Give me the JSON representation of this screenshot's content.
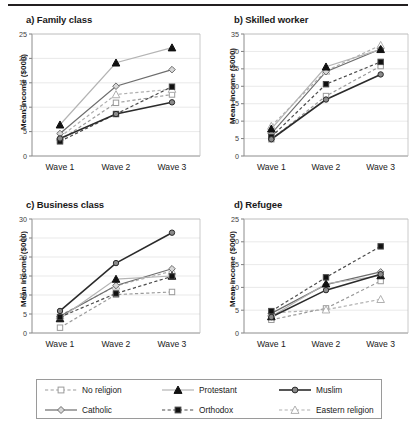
{
  "figure": {
    "ylabel": "Mean income ($000)",
    "waves": [
      "Wave 1",
      "Wave 2",
      "Wave 3"
    ]
  },
  "legend": {
    "items": [
      {
        "label": "No religion",
        "marker": "open-square",
        "dash": "dashed",
        "color": "#9b9b9b",
        "fill": "#ffffff"
      },
      {
        "label": "Catholic",
        "marker": "open-diamond",
        "dash": "solid",
        "color": "#6d6d6d",
        "fill": "#d8d8d8"
      },
      {
        "label": "Protestant",
        "marker": "filled-triangle",
        "dash": "solid",
        "color": "#b4b4b4",
        "fill": "#111111"
      },
      {
        "label": "Orthodox",
        "marker": "filled-square",
        "dash": "dashed",
        "color": "#4a4a4a",
        "fill": "#111111"
      },
      {
        "label": "Muslim",
        "marker": "filled-circle",
        "dash": "solid",
        "color": "#2b2b2b",
        "fill": "#8a8a8a"
      },
      {
        "label": "Eastern religion",
        "marker": "open-triangle",
        "dash": "dashed",
        "color": "#b0b0b0",
        "fill": "#ffffff"
      }
    ]
  },
  "chart_data": [
    {
      "type": "line",
      "panel": "a",
      "title": "a)  Family class",
      "xlabel": "",
      "ylabel": "Mean income ($000)",
      "categories": [
        "Wave 1",
        "Wave 2",
        "Wave 3"
      ],
      "ylim": [
        0,
        25
      ],
      "yticks": [
        0,
        5,
        10,
        15,
        20,
        25
      ],
      "grid": true,
      "legend_position": "below-figure",
      "series": [
        {
          "name": "No religion",
          "values": [
            3.2,
            10.9,
            12.6
          ]
        },
        {
          "name": "Catholic",
          "values": [
            4.6,
            14.3,
            17.7
          ]
        },
        {
          "name": "Protestant",
          "values": [
            6.4,
            19.1,
            22.2
          ]
        },
        {
          "name": "Orthodox",
          "values": [
            3.0,
            8.6,
            14.2
          ]
        },
        {
          "name": "Muslim",
          "values": [
            3.6,
            8.6,
            11.0
          ]
        },
        {
          "name": "Eastern religion",
          "values": [
            3.9,
            12.6,
            13.7
          ]
        }
      ]
    },
    {
      "type": "line",
      "panel": "b",
      "title": "b)  Skilled worker",
      "xlabel": "",
      "ylabel": "Mean income ($000)",
      "categories": [
        "Wave 1",
        "Wave 2",
        "Wave 3"
      ],
      "ylim": [
        0,
        35
      ],
      "yticks": [
        0,
        5,
        10,
        15,
        20,
        25,
        30,
        35
      ],
      "grid": true,
      "legend_position": "below-figure",
      "series": [
        {
          "name": "No religion",
          "values": [
            4.8,
            17.2,
            25.8
          ]
        },
        {
          "name": "Catholic",
          "values": [
            6.4,
            24.2,
            30.7
          ]
        },
        {
          "name": "Protestant",
          "values": [
            7.8,
            25.6,
            30.6
          ]
        },
        {
          "name": "Orthodox",
          "values": [
            5.5,
            20.6,
            27.0
          ]
        },
        {
          "name": "Muslim",
          "values": [
            4.8,
            16.2,
            23.4
          ]
        },
        {
          "name": "Eastern religion",
          "values": [
            8.6,
            24.4,
            31.8
          ]
        }
      ]
    },
    {
      "type": "line",
      "panel": "c",
      "title": "c)  Business class",
      "xlabel": "",
      "ylabel": "Mean income ($000)",
      "categories": [
        "Wave 1",
        "Wave 2",
        "Wave 3"
      ],
      "ylim": [
        0,
        30
      ],
      "yticks": [
        0,
        5,
        10,
        15,
        20,
        25,
        30
      ],
      "grid": true,
      "legend_position": "below-figure",
      "series": [
        {
          "name": "No religion",
          "values": [
            1.4,
            10.1,
            10.8
          ]
        },
        {
          "name": "Catholic",
          "values": [
            4.4,
            12.5,
            16.9
          ]
        },
        {
          "name": "Protestant",
          "values": [
            3.8,
            14.2,
            15.0
          ]
        },
        {
          "name": "Orthodox",
          "values": [
            4.2,
            10.4,
            14.9
          ]
        },
        {
          "name": "Muslim",
          "values": [
            5.8,
            18.4,
            26.4
          ]
        },
        {
          "name": "Eastern religion",
          "values": [
            4.6,
            12.4,
            16.3
          ]
        }
      ]
    },
    {
      "type": "line",
      "panel": "d",
      "title": "d)  Refugee",
      "xlabel": "",
      "ylabel": "Mean income ($000)",
      "categories": [
        "Wave 1",
        "Wave 2",
        "Wave 3"
      ],
      "ylim": [
        0,
        25
      ],
      "yticks": [
        0,
        5,
        10,
        15,
        20,
        25
      ],
      "grid": true,
      "legend_position": "below-figure",
      "series": [
        {
          "name": "No religion",
          "values": [
            2.9,
            5.4,
            11.4
          ]
        },
        {
          "name": "Catholic",
          "values": [
            4.3,
            10.6,
            13.4
          ]
        },
        {
          "name": "Protestant",
          "values": [
            3.6,
            10.8,
            12.6
          ]
        },
        {
          "name": "Orthodox",
          "values": [
            4.8,
            12.2,
            19.0
          ]
        },
        {
          "name": "Muslim",
          "values": [
            3.5,
            9.4,
            12.9
          ]
        },
        {
          "name": "Eastern religion",
          "values": [
            4.4,
            5.1,
            7.4
          ]
        }
      ]
    }
  ]
}
